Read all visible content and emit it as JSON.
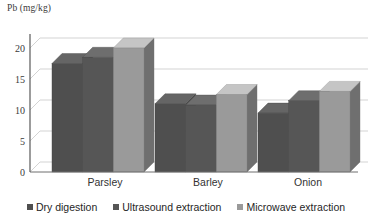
{
  "chart_data": {
    "type": "bar",
    "title": "",
    "subtitle": "",
    "xlabel": "",
    "ylabel": "Pb (mg/kg)",
    "categories": [
      "Parsley",
      "Barley",
      "Onion"
    ],
    "series": [
      {
        "name": "Dry digestion",
        "color": "#4f4f4f",
        "values": [
          17.5,
          11.0,
          9.5
        ]
      },
      {
        "name": "Ultrasound extraction",
        "color": "#565656",
        "values": [
          18.5,
          10.8,
          11.5
        ]
      },
      {
        "name": "Microwave extraction",
        "color": "#9a9a9a",
        "values": [
          20.0,
          12.5,
          13.0
        ]
      }
    ],
    "yticks": [
      0,
      5,
      10,
      15,
      20
    ],
    "ylim": [
      0,
      22
    ],
    "grid": true,
    "legend_position": "bottom",
    "style": "3d-clustered-column"
  },
  "axis": {
    "y_title": "Pb (mg/kg)",
    "tick_0": "0",
    "tick_5": "5",
    "tick_10": "10",
    "tick_15": "15",
    "tick_20": "20"
  },
  "categories": {
    "parsley": "Parsley",
    "barley": "Barley",
    "onion": "Onion"
  },
  "legend": {
    "series1": "Dry digestion",
    "series2": "Ultrasound extraction",
    "series3": "Microwave extraction"
  }
}
